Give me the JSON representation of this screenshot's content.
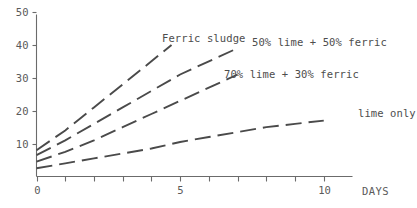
{
  "chart_data": {
    "type": "line",
    "title": "",
    "xlabel": "DAYS",
    "ylabel": "",
    "xlim": [
      0,
      11
    ],
    "ylim": [
      0,
      50
    ],
    "grid": false,
    "legend_position": "inline-annotations",
    "line_style": "dashed",
    "x_ticks": [
      0,
      1,
      2,
      3,
      4,
      5,
      6,
      7,
      8,
      9,
      10
    ],
    "x_tick_labels": [
      "0",
      "",
      "",
      "",
      "",
      "5",
      "",
      "",
      "",
      "",
      "10"
    ],
    "y_ticks": [
      10,
      20,
      30,
      40,
      50
    ],
    "y_tick_labels": [
      "10",
      "20",
      "30",
      "40",
      "50"
    ],
    "series": [
      {
        "name": "Ferric sludge",
        "label": "Ferric sludge",
        "x": [
          0,
          1,
          2,
          3,
          4,
          4.7
        ],
        "values": [
          8,
          14,
          21,
          28,
          35,
          40
        ]
      },
      {
        "name": "50% lime + 50% ferric",
        "label": "50% lime + 50% ferric",
        "x": [
          0,
          1,
          2,
          3,
          4,
          5,
          6,
          7
        ],
        "values": [
          6.5,
          11,
          16,
          21,
          26,
          31,
          35,
          39
        ]
      },
      {
        "name": "70% lime + 30% ferric",
        "label": "70% lime + 30% ferric",
        "x": [
          0,
          1,
          2,
          3,
          4,
          5,
          6,
          7
        ],
        "values": [
          4.5,
          7.5,
          11,
          15,
          19,
          23,
          27,
          31
        ]
      },
      {
        "name": "lime only",
        "label": "lime only",
        "x": [
          0,
          1,
          2,
          3,
          4,
          5,
          6,
          7,
          8,
          9,
          10
        ],
        "values": [
          2.5,
          4,
          5.5,
          7,
          8.5,
          10.5,
          12,
          13.5,
          15,
          16,
          17
        ]
      }
    ],
    "annotations": [
      {
        "text": "Ferric sludge",
        "x_px": 162,
        "y_px": 42
      },
      {
        "text": "50% lime + 50% ferric",
        "x_px": 252,
        "y_px": 46
      },
      {
        "text": "70% lime + 30% ferric",
        "x_px": 224,
        "y_px": 78
      },
      {
        "text": "lime only",
        "x_px": 358,
        "y_px": 117
      }
    ],
    "colors": {
      "background": "#ffffff",
      "axis": "#6b6b6b",
      "line": "#4a4a4a",
      "text": "#5a5a5a"
    }
  }
}
